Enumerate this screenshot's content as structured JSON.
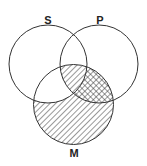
{
  "diagram": {
    "type": "venn",
    "sets": [
      {
        "id": "S",
        "label": "S",
        "cx": 48,
        "cy": 64,
        "r": 39
      },
      {
        "id": "P",
        "label": "P",
        "cx": 99,
        "cy": 64,
        "r": 39
      },
      {
        "id": "M",
        "label": "M",
        "cx": 73.5,
        "cy": 104.5,
        "r": 40
      }
    ],
    "regions": [
      {
        "region": "M only",
        "shading": "diagonal-hatch"
      },
      {
        "region": "S and P and M",
        "shading": "diagonal-hatch"
      },
      {
        "region": "P and M not S",
        "shading": "cross-hatch"
      },
      {
        "region": "S and M not P",
        "shading": "none"
      }
    ],
    "colors": {
      "stroke": "#333333",
      "background": "#ffffff"
    }
  }
}
